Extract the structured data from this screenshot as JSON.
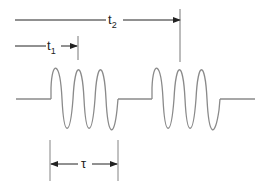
{
  "diagram": {
    "type": "pulse-train timing diagram",
    "labels": {
      "t1_main": "t",
      "t1_sub": "1",
      "t2_main": "t",
      "t2_sub": "2",
      "tau": "τ"
    },
    "colors": {
      "waveform": "#8a8a8a",
      "annotation": "#222222",
      "background": "#ffffff"
    },
    "bursts": [
      {
        "name": "burst-1",
        "start_x": 51,
        "end_x": 118,
        "cycles": 3
      },
      {
        "name": "burst-2",
        "start_x": 152,
        "end_x": 220,
        "cycles": 3
      }
    ],
    "dimensions": [
      {
        "name": "t1",
        "description": "time to first burst peak marker"
      },
      {
        "name": "t2",
        "description": "time to second burst peak marker"
      },
      {
        "name": "tau",
        "description": "burst duration"
      }
    ]
  }
}
